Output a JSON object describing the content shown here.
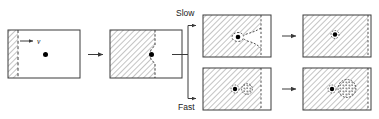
{
  "figure": {
    "name": "front-propagation-diagram",
    "background_color": "#ffffff",
    "line_color": "#3a3a3a",
    "hatch_color": "#808080",
    "particle_color": "#000000",
    "branch_labels": {
      "slow": "Slow",
      "fast": "Fast"
    },
    "velocity_label": "v",
    "panels": [
      {
        "id": "panel-initial",
        "name": "panel-initial-front",
        "caption": "",
        "front_position_fraction": 0.14,
        "front_style": "dashed-straight",
        "has_particle": true,
        "particle_x_fraction": 0.52,
        "particle_y_fraction": 0.5,
        "has_velocity_arrow": true,
        "has_nucleus": false
      },
      {
        "id": "panel-advanced",
        "name": "panel-front-reaches-particle",
        "caption": "",
        "front_position_fraction": 0.62,
        "front_style": "pinned-curved",
        "has_particle": true,
        "particle_x_fraction": 0.58,
        "particle_y_fraction": 0.5,
        "has_velocity_arrow": false,
        "has_nucleus": false
      },
      {
        "id": "panel-slow-mid",
        "name": "panel-slow-front-engulfing",
        "caption": "Slow",
        "front_position_fraction": 0.86,
        "front_style": "bowed-around-particle",
        "has_particle": true,
        "particle_x_fraction": 0.62,
        "particle_y_fraction": 0.5,
        "has_velocity_arrow": false,
        "has_nucleus": false
      },
      {
        "id": "panel-slow-final",
        "name": "panel-slow-particle-engulfed",
        "caption": "",
        "front_position_fraction": 1.0,
        "front_style": "dashed-straight-edge",
        "has_particle": true,
        "particle_x_fraction": 0.47,
        "particle_y_fraction": 0.46,
        "has_velocity_arrow": false,
        "has_nucleus": false
      },
      {
        "id": "panel-fast-mid",
        "name": "panel-fast-front-with-void",
        "caption": "Fast",
        "front_position_fraction": 0.86,
        "front_style": "dashed-straight-edge",
        "has_particle": true,
        "particle_x_fraction": 0.57,
        "particle_y_fraction": 0.5,
        "has_velocity_arrow": false,
        "has_nucleus": true,
        "nucleus_x_fraction": 0.72,
        "nucleus_y_fraction": 0.5,
        "nucleus_radius_fraction": 0.11
      },
      {
        "id": "panel-fast-final",
        "name": "panel-fast-void-grown",
        "caption": "",
        "front_position_fraction": 1.0,
        "front_style": "dashed-straight-edge",
        "has_particle": true,
        "particle_x_fraction": 0.46,
        "particle_y_fraction": 0.5,
        "has_velocity_arrow": false,
        "has_nucleus": true,
        "nucleus_x_fraction": 0.64,
        "nucleus_y_fraction": 0.5,
        "nucleus_radius_fraction": 0.19
      }
    ],
    "arrows": [
      {
        "name": "arrow-stage1-to-stage2",
        "direction": "right"
      },
      {
        "name": "arrow-stage2-to-branch",
        "direction": "right"
      },
      {
        "name": "arrow-branch-to-slow",
        "direction": "right"
      },
      {
        "name": "arrow-branch-to-fast",
        "direction": "right"
      },
      {
        "name": "arrow-slow-to-final",
        "direction": "right"
      },
      {
        "name": "arrow-fast-to-final",
        "direction": "right"
      }
    ]
  }
}
